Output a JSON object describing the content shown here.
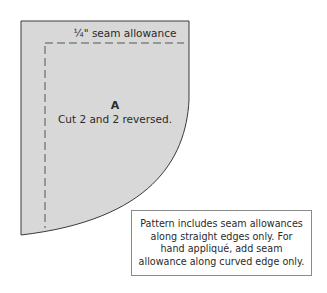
{
  "piece": {
    "seam_label": "¼\" seam allowance",
    "letter": "A",
    "instruction": "Cut 2 and 2 reversed.",
    "fill_color": "#d8d8d8",
    "outline_color": "#3a3a3a",
    "dash_color": "#555555"
  },
  "note": {
    "text": "Pattern includes seam allowances along straight edges only. For hand appliqué, add seam allowance along curved edge only."
  }
}
